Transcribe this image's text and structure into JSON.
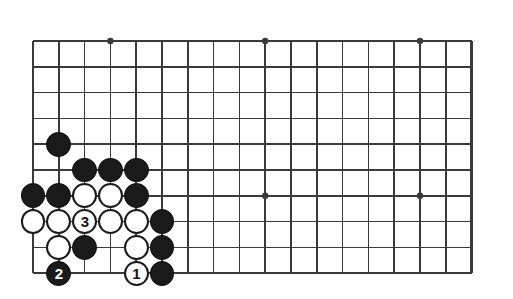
{
  "figure": {
    "kind": "go-board-diagram",
    "title": "",
    "board": {
      "columns": 18,
      "rows": 10,
      "origin_x": 33,
      "origin_y": 41,
      "spacing": 25.8,
      "line_color": "#3a3a3a",
      "line_width": 1.6,
      "edge_line_width": 2.4,
      "background_color": "#ffffff",
      "star_points": [
        {
          "col": 4,
          "row": 1
        },
        {
          "col": 10,
          "row": 1
        },
        {
          "col": 16,
          "row": 1
        },
        {
          "col": 10,
          "row": 7
        },
        {
          "col": 16,
          "row": 7
        }
      ],
      "star_radius": 3.2
    },
    "stone_radius": 12.4,
    "colors": {
      "black": "#1a1a1a",
      "white": "#ffffff",
      "black_label": "#ffffff",
      "white_label": "#141414"
    },
    "stones": [
      {
        "col": 2,
        "row": 5,
        "color": "black",
        "label": ""
      },
      {
        "col": 3,
        "row": 6,
        "color": "black",
        "label": ""
      },
      {
        "col": 4,
        "row": 6,
        "color": "black",
        "label": ""
      },
      {
        "col": 5,
        "row": 6,
        "color": "black",
        "label": ""
      },
      {
        "col": 1,
        "row": 7,
        "color": "black",
        "label": ""
      },
      {
        "col": 2,
        "row": 7,
        "color": "black",
        "label": ""
      },
      {
        "col": 3,
        "row": 7,
        "color": "white",
        "label": ""
      },
      {
        "col": 4,
        "row": 7,
        "color": "white",
        "label": ""
      },
      {
        "col": 5,
        "row": 7,
        "color": "black",
        "label": ""
      },
      {
        "col": 1,
        "row": 8,
        "color": "white",
        "label": ""
      },
      {
        "col": 2,
        "row": 8,
        "color": "white",
        "label": ""
      },
      {
        "col": 3,
        "row": 8,
        "color": "white",
        "label": "3"
      },
      {
        "col": 4,
        "row": 8,
        "color": "white",
        "label": ""
      },
      {
        "col": 5,
        "row": 8,
        "color": "white",
        "label": ""
      },
      {
        "col": 6,
        "row": 8,
        "color": "black",
        "label": ""
      },
      {
        "col": 2,
        "row": 9,
        "color": "white",
        "label": ""
      },
      {
        "col": 3,
        "row": 9,
        "color": "black",
        "label": ""
      },
      {
        "col": 5,
        "row": 9,
        "color": "white",
        "label": ""
      },
      {
        "col": 6,
        "row": 9,
        "color": "black",
        "label": ""
      },
      {
        "col": 2,
        "row": 10,
        "color": "black",
        "label": "2"
      },
      {
        "col": 5,
        "row": 10,
        "color": "white",
        "label": "1"
      },
      {
        "col": 6,
        "row": 10,
        "color": "black",
        "label": ""
      }
    ],
    "move_labels": [
      {
        "number": "1",
        "color": "white"
      },
      {
        "number": "2",
        "color": "black"
      },
      {
        "number": "3",
        "color": "white"
      }
    ]
  }
}
